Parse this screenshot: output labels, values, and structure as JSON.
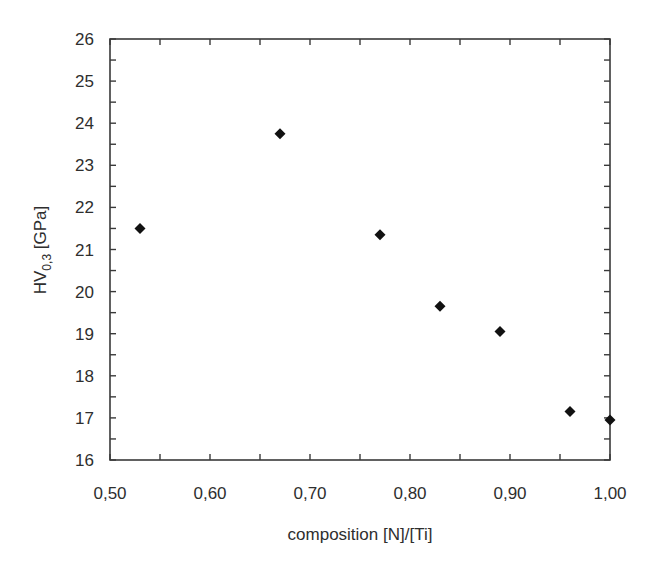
{
  "chart_data": {
    "type": "scatter",
    "title": "",
    "xlabel": "composition [N]/[Ti]",
    "ylabel": "HV0,3 [GPa]",
    "ylabel_parts": {
      "main": "HV",
      "subscript": "0,3",
      "unit": " [GPa]"
    },
    "xlim": [
      0.5,
      1.0
    ],
    "ylim": [
      16,
      26
    ],
    "x_ticks": [
      0.5,
      0.6,
      0.7,
      0.8,
      0.9,
      1.0
    ],
    "x_tick_labels": [
      "0,50",
      "0,60",
      "0,70",
      "0,80",
      "0,90",
      "1,00"
    ],
    "x_minor_step": 0.05,
    "y_ticks": [
      16,
      17,
      18,
      19,
      20,
      21,
      22,
      23,
      24,
      25,
      26
    ],
    "y_tick_labels": [
      "16",
      "17",
      "18",
      "19",
      "20",
      "21",
      "22",
      "23",
      "24",
      "25",
      "26"
    ],
    "y_minor_step": 0.5,
    "grid": false,
    "legend": null,
    "marker": "diamond",
    "marker_color": "#111111",
    "series": [
      {
        "name": "HV0,3",
        "x": [
          0.53,
          0.67,
          0.77,
          0.83,
          0.89,
          0.96,
          1.0
        ],
        "y": [
          21.5,
          23.75,
          21.35,
          19.65,
          19.05,
          17.15,
          16.95
        ]
      }
    ]
  }
}
